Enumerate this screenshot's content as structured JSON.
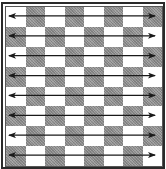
{
  "diagram": {
    "type": "chessboard-arrows",
    "board": {
      "rows": 8,
      "cols": 8,
      "top_left_square": "light",
      "light_color": "#ffffff",
      "dark_color": "#9a9a9a",
      "frame_color": "#2a2a2a"
    },
    "arrows": [
      {
        "row": 1,
        "direction": "bidirectional-horizontal",
        "from_col": 1,
        "to_col": 8
      },
      {
        "row": 2,
        "direction": "bidirectional-horizontal",
        "from_col": 1,
        "to_col": 8
      },
      {
        "row": 3,
        "direction": "bidirectional-horizontal",
        "from_col": 1,
        "to_col": 8
      },
      {
        "row": 4,
        "direction": "bidirectional-horizontal",
        "from_col": 1,
        "to_col": 8
      },
      {
        "row": 5,
        "direction": "bidirectional-horizontal",
        "from_col": 1,
        "to_col": 8
      },
      {
        "row": 6,
        "direction": "bidirectional-horizontal",
        "from_col": 1,
        "to_col": 8
      },
      {
        "row": 7,
        "direction": "bidirectional-horizontal",
        "from_col": 1,
        "to_col": 8
      },
      {
        "row": 8,
        "direction": "bidirectional-horizontal",
        "from_col": 1,
        "to_col": 8
      }
    ],
    "arrow_color": "#1a1a1a",
    "icons": [
      "double-headed-arrow-icon"
    ]
  }
}
